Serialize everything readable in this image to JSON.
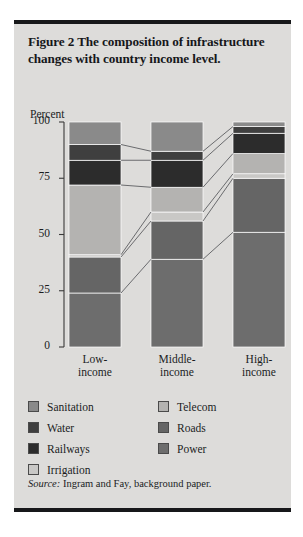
{
  "figure": {
    "title": "Figure 2  The composition of infrastructure changes with country income level.",
    "source_prefix": "Source:",
    "source_text": " Ingram and Fay, background paper."
  },
  "chart_data": {
    "type": "bar",
    "stacked": true,
    "title": "Figure 2  The composition of infrastructure changes with country income level.",
    "xlabel": "",
    "ylabel": "Percent",
    "ylim": [
      0,
      100
    ],
    "yticks": [
      0,
      25,
      50,
      75,
      100
    ],
    "ytick_labels": [
      "0",
      "25",
      "50",
      "75",
      "100"
    ],
    "grid": false,
    "legend_position": "below",
    "categories": [
      "Low-income",
      "Middle-income",
      "High-income"
    ],
    "category_lines": [
      [
        "Low-",
        "income"
      ],
      [
        "Middle-",
        "income"
      ],
      [
        "High-",
        "income"
      ]
    ],
    "series": [
      {
        "name": "Power",
        "color": "#6d6d6d",
        "values": [
          24,
          39,
          51
        ]
      },
      {
        "name": "Roads",
        "color": "#656565",
        "values": [
          16,
          17,
          24
        ]
      },
      {
        "name": "Irrigation",
        "color": "#c9c8c6",
        "values": [
          1,
          4,
          2
        ]
      },
      {
        "name": "Telecom",
        "color": "#b4b3b1",
        "values": [
          31,
          11,
          9
        ]
      },
      {
        "name": "Railways",
        "color": "#2c2c2c",
        "values": [
          11,
          12,
          9
        ]
      },
      {
        "name": "Water",
        "color": "#3f3f3f",
        "values": [
          7,
          4,
          3
        ]
      },
      {
        "name": "Sanitation",
        "color": "#8a8a8a",
        "values": [
          10,
          13,
          2
        ]
      }
    ],
    "stack_order_bottom_to_top": [
      "Power",
      "Roads",
      "Irrigation",
      "Telecom",
      "Railways",
      "Water",
      "Sanitation"
    ],
    "connector_lines": true
  },
  "legend": {
    "left_column": [
      {
        "label": "Sanitation",
        "color": "#8a8a8a"
      },
      {
        "label": "Water",
        "color": "#3f3f3f"
      },
      {
        "label": "Railways",
        "color": "#2c2c2c"
      },
      {
        "label": "Irrigation",
        "color": "#c9c8c6"
      }
    ],
    "right_column": [
      {
        "label": "Telecom",
        "color": "#b4b3b1"
      },
      {
        "label": "Roads",
        "color": "#656565"
      },
      {
        "label": "Power",
        "color": "#6d6d6d"
      }
    ]
  }
}
